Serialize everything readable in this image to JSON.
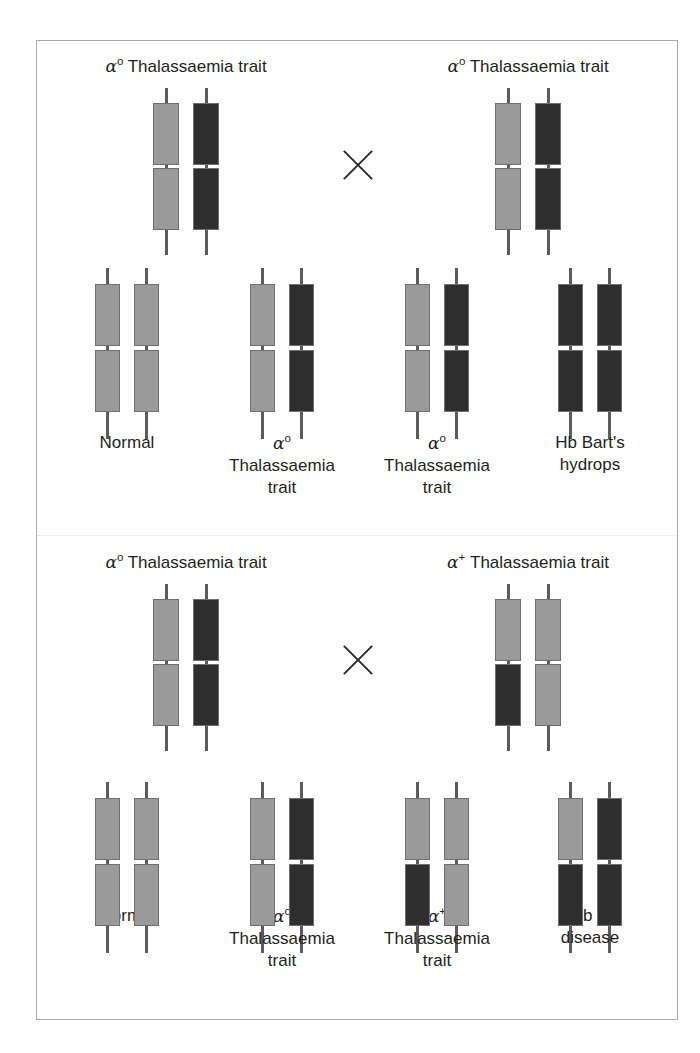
{
  "figure": {
    "cross_symbol": "×"
  },
  "colors": {
    "normal_gene_block": "#9a9a9a",
    "deleted_gene_block": "#2e2e2e",
    "stalk": "#5b5b5b",
    "frame": "#a9a9a9",
    "divider": "#e2e0e4",
    "text": "#231f20"
  },
  "legend": {
    "light_block_meaning": "normal alpha globin gene",
    "dark_block_meaning": "deleted / non-functional alpha globin gene"
  },
  "sections": [
    {
      "id": "cross-1",
      "parents": [
        {
          "id": "p1-left",
          "label_alpha": "α",
          "label_sup": "o",
          "label_rest": " Thalassaemia trait",
          "label_plain": "αᵒ Thalassaemia trait",
          "chromosomes": [
            {
              "arms": [
                "light",
                "light"
              ]
            },
            {
              "arms": [
                "dark",
                "dark"
              ]
            }
          ]
        },
        {
          "id": "p1-right",
          "label_alpha": "α",
          "label_sup": "o",
          "label_rest": " Thalassaemia trait",
          "label_plain": "αᵒ Thalassaemia trait",
          "chromosomes": [
            {
              "arms": [
                "light",
                "light"
              ]
            },
            {
              "arms": [
                "dark",
                "dark"
              ]
            }
          ]
        }
      ],
      "offspring": [
        {
          "id": "c1-1",
          "label_line1": "Normal",
          "label_line2": "",
          "label_line3": "",
          "label_alpha": "",
          "label_sup": "",
          "chromosomes": [
            {
              "arms": [
                "light",
                "light"
              ]
            },
            {
              "arms": [
                "light",
                "light"
              ]
            }
          ]
        },
        {
          "id": "c1-2",
          "label_alpha": "α",
          "label_sup": "o",
          "label_line1": "",
          "label_line2": "Thalassaemia",
          "label_line3": "trait",
          "label_plain": "αᵒ Thalassaemia trait",
          "chromosomes": [
            {
              "arms": [
                "light",
                "light"
              ]
            },
            {
              "arms": [
                "dark",
                "dark"
              ]
            }
          ]
        },
        {
          "id": "c1-3",
          "label_alpha": "α",
          "label_sup": "o",
          "label_line1": "",
          "label_line2": "Thalassaemia",
          "label_line3": "trait",
          "label_plain": "αᵒ Thalassaemia trait",
          "chromosomes": [
            {
              "arms": [
                "light",
                "light"
              ]
            },
            {
              "arms": [
                "dark",
                "dark"
              ]
            }
          ]
        },
        {
          "id": "c1-4",
          "label_alpha": "",
          "label_sup": "",
          "label_line1": "Hb Bart's",
          "label_line2": "hydrops",
          "label_line3": "",
          "chromosomes": [
            {
              "arms": [
                "dark",
                "dark"
              ]
            },
            {
              "arms": [
                "dark",
                "dark"
              ]
            }
          ]
        }
      ]
    },
    {
      "id": "cross-2",
      "parents": [
        {
          "id": "p2-left",
          "label_alpha": "α",
          "label_sup": "o",
          "label_rest": " Thalassaemia trait",
          "label_plain": "αᵒ Thalassaemia trait",
          "chromosomes": [
            {
              "arms": [
                "light",
                "light"
              ]
            },
            {
              "arms": [
                "dark",
                "dark"
              ]
            }
          ]
        },
        {
          "id": "p2-right",
          "label_alpha": "α",
          "label_sup": "+",
          "label_rest": " Thalassaemia trait",
          "label_plain": "α⁺ Thalassaemia trait",
          "chromosomes": [
            {
              "arms": [
                "light",
                "dark"
              ]
            },
            {
              "arms": [
                "light",
                "light"
              ]
            }
          ]
        }
      ],
      "offspring": [
        {
          "id": "c2-1",
          "label_alpha": "",
          "label_sup": "",
          "label_line1": "Normal",
          "label_line2": "",
          "label_line3": "",
          "chromosomes": [
            {
              "arms": [
                "light",
                "light"
              ]
            },
            {
              "arms": [
                "light",
                "light"
              ]
            }
          ]
        },
        {
          "id": "c2-2",
          "label_alpha": "α",
          "label_sup": "o",
          "label_line1": "",
          "label_line2": "Thalassaemia",
          "label_line3": "trait",
          "label_plain": "αᵒ Thalassaemia trait",
          "chromosomes": [
            {
              "arms": [
                "light",
                "light"
              ]
            },
            {
              "arms": [
                "dark",
                "dark"
              ]
            }
          ]
        },
        {
          "id": "c2-3",
          "label_alpha": "α",
          "label_sup": "+",
          "label_line1": "",
          "label_line2": "Thalassaemia",
          "label_line3": "trait",
          "label_plain": "α⁺ Thalassaemia trait",
          "chromosomes": [
            {
              "arms": [
                "light",
                "dark"
              ]
            },
            {
              "arms": [
                "light",
                "light"
              ]
            }
          ]
        },
        {
          "id": "c2-4",
          "label_alpha": "",
          "label_sup": "",
          "label_line1": "Hb H",
          "label_line2": "disease",
          "label_line3": "",
          "chromosomes": [
            {
              "arms": [
                "light",
                "dark"
              ]
            },
            {
              "arms": [
                "dark",
                "dark"
              ]
            }
          ]
        }
      ]
    }
  ]
}
